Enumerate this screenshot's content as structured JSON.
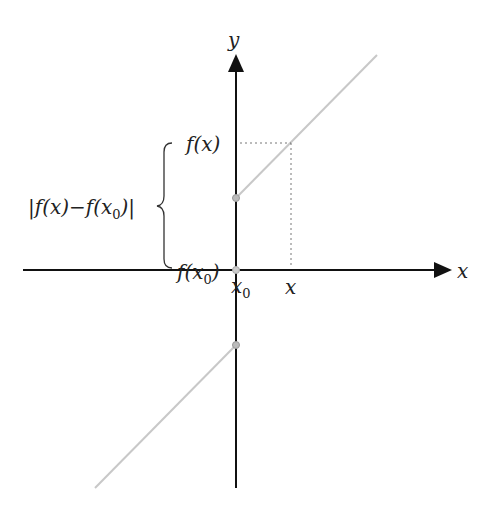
{
  "diagram": {
    "axes": {
      "x_label": "x",
      "y_label": "y"
    },
    "labels": {
      "fx": "f(x)",
      "fx0_prefix": "f(x",
      "fx0_sub": "0",
      "fx0_suffix": ")",
      "x0_main": "x",
      "x0_sub": "0",
      "x_tick": "x",
      "diff_prefix": "|f(x)−f(x",
      "diff_sub": "0",
      "diff_suffix": ")|"
    },
    "colors": {
      "axis": "#111111",
      "graph_line": "#c8c8c8",
      "dotted_guide": "#777777",
      "point": "#bbbbbb"
    }
  }
}
